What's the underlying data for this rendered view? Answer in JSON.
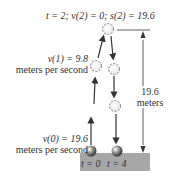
{
  "top_label": "t = 2; v(2) = 0; s(2) = 19.6",
  "v1_label": {
    "line1": "v(1) = 9.8",
    "line2": "meters per second"
  },
  "v0_label": {
    "line1": "v(0) = 19.6",
    "line2": "meters per second"
  },
  "height_label": {
    "line1": "19.6",
    "line2": "meters"
  },
  "ground_labels": {
    "start": "t = 0",
    "end": "t = 4"
  },
  "colors": {
    "ground": "#a6a6a6",
    "line": "#333333",
    "ball_dashed": "#666666"
  }
}
